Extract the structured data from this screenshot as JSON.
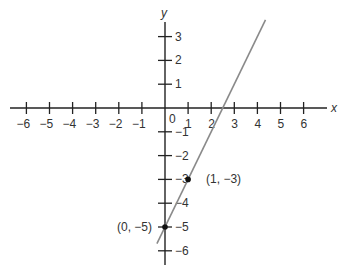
{
  "figure": {
    "x_axis_label": "x",
    "y_axis_label": "y",
    "origin_label": "0",
    "x_ticks": [
      {
        "value": -6,
        "label": "−6"
      },
      {
        "value": -5,
        "label": "−5"
      },
      {
        "value": -4,
        "label": "−4"
      },
      {
        "value": -3,
        "label": "−3"
      },
      {
        "value": -2,
        "label": "−2"
      },
      {
        "value": -1,
        "label": "−1"
      },
      {
        "value": 1,
        "label": "1"
      },
      {
        "value": 2,
        "label": "2"
      },
      {
        "value": 3,
        "label": "3"
      },
      {
        "value": 4,
        "label": "4"
      },
      {
        "value": 5,
        "label": "5"
      },
      {
        "value": 6,
        "label": "6"
      }
    ],
    "y_ticks": [
      {
        "value": 3,
        "label": "3"
      },
      {
        "value": 2,
        "label": "2"
      },
      {
        "value": 1,
        "label": "1"
      },
      {
        "value": -1,
        "label": "−1"
      },
      {
        "value": -2,
        "label": "−2"
      },
      {
        "value": -3,
        "label": "−3"
      },
      {
        "value": -4,
        "label": "−4"
      },
      {
        "value": -5,
        "label": "−5"
      },
      {
        "value": -6,
        "label": "−6"
      }
    ],
    "line": {
      "slope": 2,
      "intercept": -5,
      "color": "#8a8a8a"
    },
    "points": [
      {
        "x": 0,
        "y": -5,
        "label": "(0, −5)",
        "label_side": "left"
      },
      {
        "x": 1,
        "y": -3,
        "label": "(1, −3)",
        "label_side": "right"
      }
    ],
    "colors": {
      "axis": "#222222",
      "point": "#111111",
      "line": "#8a8a8a"
    }
  }
}
